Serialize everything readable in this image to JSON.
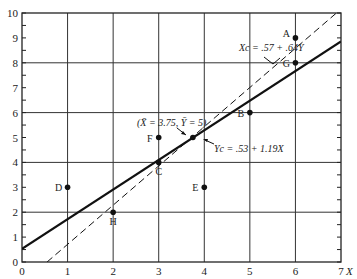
{
  "chart_data": {
    "type": "scatter",
    "title": "",
    "xlabel": "X",
    "ylabel": "",
    "xlim": [
      0,
      7
    ],
    "ylim": [
      0,
      10
    ],
    "grid": true,
    "x_ticks": [
      "0",
      "1",
      "2",
      "3",
      "4",
      "5",
      "6",
      "7"
    ],
    "y_ticks": [
      "0",
      "1",
      "2",
      "3",
      "4",
      "5",
      "6",
      "7",
      "8",
      "9",
      "10"
    ],
    "points": [
      {
        "label": "A",
        "x": 6,
        "y": 9
      },
      {
        "label": "G",
        "x": 6,
        "y": 8
      },
      {
        "label": "B",
        "x": 5,
        "y": 6
      },
      {
        "label": "F",
        "x": 3,
        "y": 5
      },
      {
        "label": "C",
        "x": 3,
        "y": 4
      },
      {
        "label": "E",
        "x": 4,
        "y": 3
      },
      {
        "label": "D",
        "x": 1,
        "y": 3
      },
      {
        "label": "H",
        "x": 2,
        "y": 2
      }
    ],
    "mean_point": {
      "x": 3.75,
      "y": 5,
      "label": "(X̄ = 3.75, Ȳ = 5)"
    },
    "lines": [
      {
        "name": "Y on X regression",
        "style": "solid",
        "intercept": 0.53,
        "slope": 1.19,
        "label": "Yc = .53 + 1.19X"
      },
      {
        "name": "X on Y regression",
        "style": "dashed",
        "x_intercept": 0.57,
        "x_slope_on_y": 0.64,
        "label": "Xc = .57 + .64Y"
      }
    ]
  }
}
